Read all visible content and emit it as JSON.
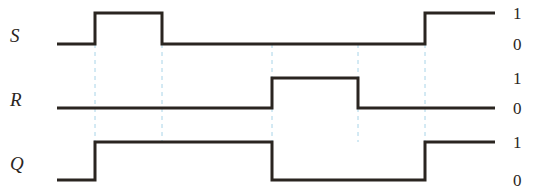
{
  "diagram": {
    "type": "timing-diagram",
    "width": 541,
    "height": 192,
    "background_color": "#ffffff",
    "wave_color": "#2a2520",
    "wave_stroke_width": 3,
    "guide_color": "#a8d4e8",
    "guide_stroke_width": 1,
    "guide_dash": "4 4",
    "x_start": 57,
    "x_end": 495
  },
  "signals": [
    {
      "name": "S",
      "label": "S",
      "high_label": "1",
      "low_label": "0",
      "y_high": 13,
      "y_low": 44,
      "initial_level": 0,
      "transitions": [
        {
          "x": 95,
          "to": 1
        },
        {
          "x": 162,
          "to": 0
        },
        {
          "x": 425,
          "to": 1
        }
      ],
      "segments": [
        {
          "from": 57,
          "to": 95,
          "level": 0
        },
        {
          "from": 95,
          "to": 162,
          "level": 1
        },
        {
          "from": 162,
          "to": 425,
          "level": 0
        },
        {
          "from": 425,
          "to": 495,
          "level": 1
        }
      ]
    },
    {
      "name": "R",
      "label": "R",
      "high_label": "1",
      "low_label": "0",
      "y_high": 78,
      "y_low": 108,
      "initial_level": 0,
      "transitions": [
        {
          "x": 272,
          "to": 1
        },
        {
          "x": 358,
          "to": 0
        }
      ],
      "segments": [
        {
          "from": 57,
          "to": 272,
          "level": 0
        },
        {
          "from": 272,
          "to": 358,
          "level": 1
        },
        {
          "from": 358,
          "to": 495,
          "level": 0
        }
      ]
    },
    {
      "name": "Q",
      "label": "Q",
      "high_label": "1",
      "low_label": "0",
      "y_high": 142,
      "y_low": 180,
      "initial_level": 0,
      "transitions": [
        {
          "x": 95,
          "to": 1
        },
        {
          "x": 272,
          "to": 0
        },
        {
          "x": 425,
          "to": 1
        }
      ],
      "segments": [
        {
          "from": 57,
          "to": 95,
          "level": 0
        },
        {
          "from": 95,
          "to": 272,
          "level": 1
        },
        {
          "from": 272,
          "to": 425,
          "level": 0
        },
        {
          "from": 425,
          "to": 495,
          "level": 1
        }
      ]
    }
  ],
  "guide_lines": [
    {
      "x": 95,
      "y1": 44,
      "y2": 142
    },
    {
      "x": 162,
      "y1": 44,
      "y2": 142
    },
    {
      "x": 272,
      "y1": 108,
      "y2": 142
    },
    {
      "x": 358,
      "y1": 108,
      "y2": 142
    },
    {
      "x": 425,
      "y1": 44,
      "y2": 142
    }
  ],
  "guide_lines_upper": [
    {
      "x": 272,
      "y1": 44,
      "y2": 78
    },
    {
      "x": 358,
      "y1": 44,
      "y2": 78
    }
  ]
}
